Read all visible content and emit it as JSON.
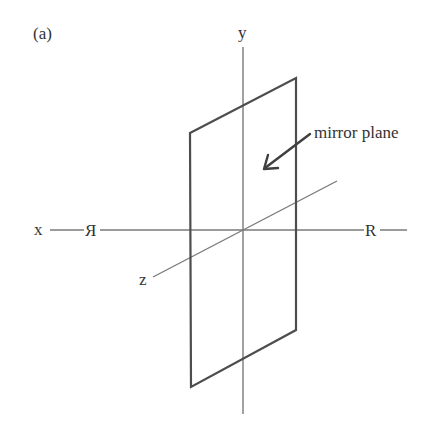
{
  "figure": {
    "panel_label": "(a)",
    "axes": {
      "x_label": "x",
      "y_label": "y",
      "z_label": "z"
    },
    "markers": {
      "left_letter": "Я",
      "right_letter": "R"
    },
    "annotation": {
      "text": "mirror plane"
    },
    "colors": {
      "axis": "#7a7a7a",
      "plane": "#4d4d4d",
      "text": "#333333",
      "background": "#ffffff"
    }
  }
}
